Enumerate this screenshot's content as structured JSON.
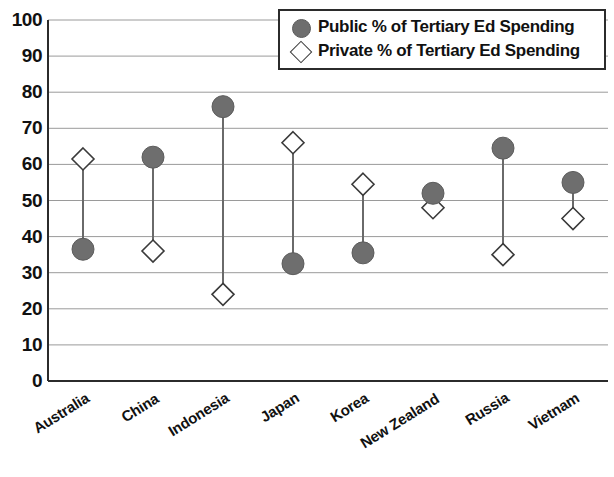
{
  "chart_data": {
    "type": "scatter",
    "title": "",
    "subtitle": "",
    "xlabel": "",
    "ylabel": "",
    "ylim": [
      0,
      100
    ],
    "ytick_step": 10,
    "yticks": [
      0,
      10,
      20,
      30,
      40,
      50,
      60,
      70,
      80,
      90,
      100
    ],
    "grid": true,
    "grid_axis": "y",
    "legend_position": "top-right",
    "connector_lines": true,
    "categories": [
      "Australia",
      "China",
      "Indonesia",
      "Japan",
      "Korea",
      "New Zealand",
      "Russia",
      "Vietnam"
    ],
    "series": [
      {
        "name": "Public % of Tertiary Ed Spending",
        "marker": "filled-circle",
        "color": "#6e6e6e",
        "values": [
          36.5,
          62,
          76,
          32.5,
          35.5,
          52,
          64.5,
          55
        ]
      },
      {
        "name": "Private % of Tertiary Ed Spending",
        "marker": "open-diamond",
        "color": "#ffffff",
        "edge_color": "#3a3a3a",
        "values": [
          61.5,
          36,
          24,
          66,
          54.5,
          48,
          35,
          45
        ]
      }
    ]
  },
  "legend": {
    "entries": [
      {
        "label": "Public % of Tertiary Ed Spending",
        "marker": "filled-circle"
      },
      {
        "label": "Private % of Tertiary Ed Spending",
        "marker": "open-diamond"
      }
    ]
  },
  "colors": {
    "public_marker": "#6e6e6e",
    "private_marker_edge": "#3a3a3a",
    "gridline": "#9a9a9a",
    "axis": "#2b2b2b",
    "connector": "#6a6a6a",
    "background": "#ffffff"
  },
  "geometry": {
    "plot_left": 48,
    "plot_right": 608,
    "plot_top": 20,
    "plot_bottom": 381
  }
}
